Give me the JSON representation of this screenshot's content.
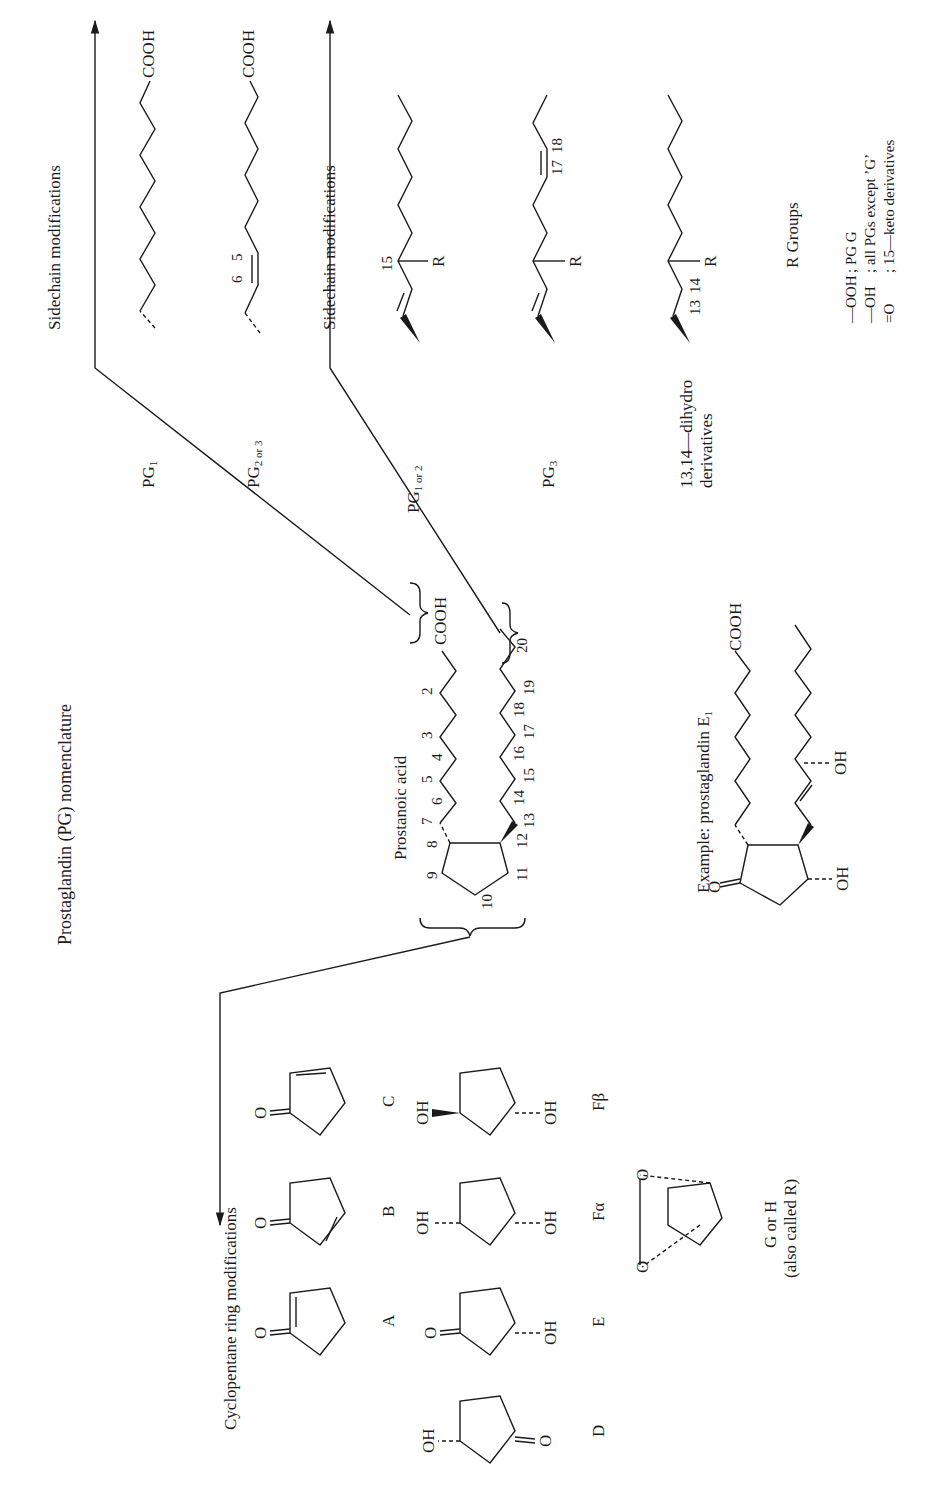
{
  "page": {
    "title": "Prostaglandin (PG) nomenclature"
  },
  "prostanoic_acid": {
    "label": "Prostanoic acid",
    "carboxyl": "COOH",
    "carbon_numbers_upper": [
      "10",
      "9",
      "8",
      "7",
      "6",
      "5",
      "4",
      "3",
      "2"
    ],
    "carbon_numbers_lower": [
      "11",
      "12",
      "13",
      "14",
      "15",
      "16",
      "17",
      "18",
      "19",
      "20"
    ]
  },
  "example": {
    "label": "Example: prostaglandin E",
    "label_sub": "1",
    "carboxyl": "COOH",
    "ketone": "O",
    "hydroxyl_ring": "OH",
    "hydroxyl_chain": "OH"
  },
  "sidechain_upper": {
    "heading": "Sidechain modifications",
    "items": [
      {
        "label": "PG",
        "sub": "1",
        "carboxyl": "COOH"
      },
      {
        "label": "PG",
        "sub": "2 or 3",
        "carboxyl": "COOH",
        "positions": [
          "6",
          "5"
        ]
      }
    ]
  },
  "sidechain_lower": {
    "heading": "Sidechain modifications",
    "items": [
      {
        "label": "PG",
        "sub": "1 or 2",
        "positions": [
          "15"
        ],
        "r": "R"
      },
      {
        "label": "PG",
        "sub": "3",
        "positions": [
          "17",
          "18"
        ],
        "r": "R"
      },
      {
        "label_line1": "13,14—dihydro",
        "label_line2": "derivatives",
        "positions": [
          "13",
          "14"
        ],
        "r": "R"
      }
    ]
  },
  "r_groups": {
    "heading": "R Groups",
    "rows": [
      {
        "group": "—OOH",
        "desc": "; PG G"
      },
      {
        "group": "—OH",
        "desc": "; all PGs except ’G’"
      },
      {
        "group": "=O",
        "desc": "; 15—keto derivatives"
      }
    ]
  },
  "ring_modifications": {
    "heading": "Cyclopentane ring modifications",
    "rings": [
      {
        "id": "D",
        "label": "D",
        "subst": [
          "OH",
          "O"
        ]
      },
      {
        "id": "A",
        "label": "A",
        "subst": [
          "O"
        ]
      },
      {
        "id": "E",
        "label": "E",
        "subst": [
          "O",
          "OH"
        ]
      },
      {
        "id": "B",
        "label": "B",
        "subst": [
          "O"
        ]
      },
      {
        "id": "F-alpha",
        "label": "Fα",
        "subst": [
          "OH",
          "OH"
        ]
      },
      {
        "id": "C",
        "label": "C",
        "subst": [
          "O"
        ]
      },
      {
        "id": "F-beta",
        "label": "Fβ",
        "subst": [
          "OH",
          "OH"
        ]
      },
      {
        "id": "G-H",
        "label_line1": "G or H",
        "label_line2": "(also called R)",
        "subst": [
          "O",
          "O"
        ]
      }
    ]
  }
}
